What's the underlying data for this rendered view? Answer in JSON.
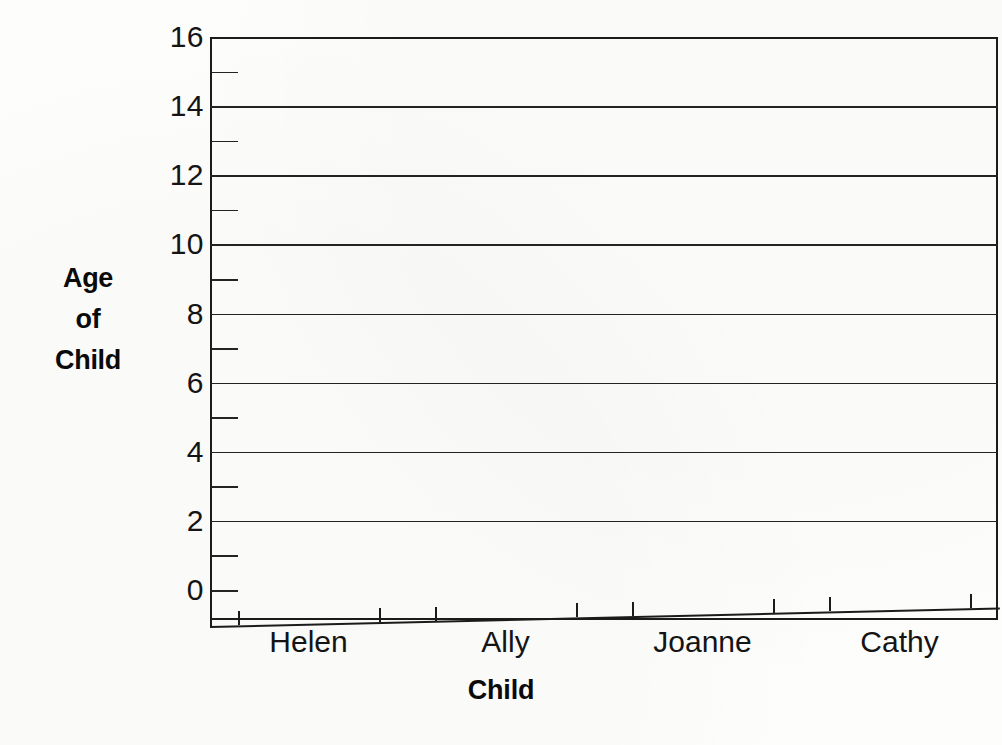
{
  "chart_data": {
    "type": "bar",
    "title": "",
    "xlabel": "Child",
    "ylabel": "Age of Child",
    "ylabel_lines": [
      "Age",
      "of",
      "Child"
    ],
    "categories": [
      "Helen",
      "Ally",
      "Joanne",
      "Cathy"
    ],
    "values": [
      null,
      null,
      null,
      null
    ],
    "series": [
      {
        "name": "Age of Child",
        "values": [
          null,
          null,
          null,
          null
        ]
      }
    ],
    "ylim": [
      0,
      16
    ],
    "y_major_ticks": [
      0,
      2,
      4,
      6,
      8,
      10,
      12,
      14,
      16
    ],
    "y_minor_ticks": [
      1,
      3,
      5,
      7,
      9,
      11,
      13,
      15
    ],
    "y_tick_labels": [
      "16",
      "14",
      "12",
      "10",
      "8",
      "6",
      "4",
      "2",
      "0"
    ],
    "gridlines_at": [
      2,
      4,
      6,
      8,
      10,
      12,
      14,
      16
    ],
    "grid": true,
    "legend": false,
    "legend_position": "none",
    "note": "Blank worksheet grid - no bars plotted"
  },
  "axes": {
    "y": {
      "label_lines": [
        "Age",
        "of",
        "Child"
      ],
      "ticks": [
        {
          "value": 16,
          "label": "16",
          "major": true
        },
        {
          "value": 15,
          "label": "",
          "major": false
        },
        {
          "value": 14,
          "label": "14",
          "major": true
        },
        {
          "value": 13,
          "label": "",
          "major": false
        },
        {
          "value": 12,
          "label": "12",
          "major": true
        },
        {
          "value": 11,
          "label": "",
          "major": false
        },
        {
          "value": 10,
          "label": "10",
          "major": true
        },
        {
          "value": 9,
          "label": "",
          "major": false
        },
        {
          "value": 8,
          "label": "8",
          "major": true
        },
        {
          "value": 7,
          "label": "",
          "major": false
        },
        {
          "value": 6,
          "label": "6",
          "major": true
        },
        {
          "value": 5,
          "label": "",
          "major": false
        },
        {
          "value": 4,
          "label": "4",
          "major": true
        },
        {
          "value": 3,
          "label": "",
          "major": false
        },
        {
          "value": 2,
          "label": "2",
          "major": true
        },
        {
          "value": 1,
          "label": "",
          "major": false
        },
        {
          "value": 0,
          "label": "0",
          "major": true
        }
      ]
    },
    "x": {
      "label": "Child",
      "categories": [
        {
          "label": "Helen"
        },
        {
          "label": "Ally"
        },
        {
          "label": "Joanne"
        },
        {
          "label": "Cathy"
        }
      ]
    }
  },
  "colors": {
    "ink": "#1b1b1b",
    "grid": "#232323",
    "paper": "#fdfdfc",
    "text": "#141414"
  }
}
